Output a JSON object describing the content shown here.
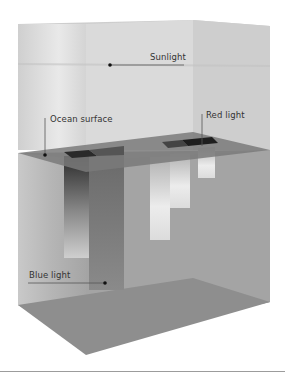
{
  "diagram": {
    "title_cut": "",
    "labels": {
      "sunlight": "Sunlight",
      "ocean_surface": "Ocean surface",
      "red_light": "Red light",
      "blue_light": "Blue light"
    },
    "colors": {
      "air_box": "#d8d8d8",
      "water_box": "#a6a6a6",
      "surface_plane": "#7c7c7c",
      "floor": "#8e8e8e",
      "label_text": "#333333",
      "leader_line": "#555555"
    }
  }
}
